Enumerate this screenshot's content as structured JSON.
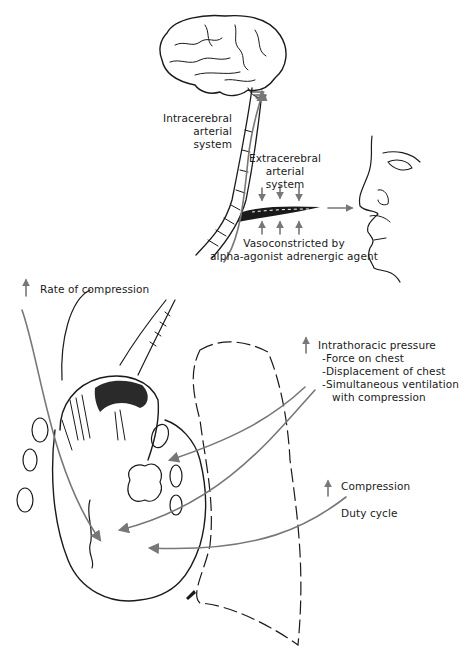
{
  "figure": {
    "colors": {
      "ink": "#1a1a1a",
      "arrow": "#777777",
      "background": "#ffffff"
    },
    "labels": {
      "intracerebral": [
        "Intracerebral",
        "arterial",
        "system"
      ],
      "extracerebral": [
        "Extracerebral",
        "arterial",
        "system"
      ],
      "vasoconstricted": [
        "Vasoconstricted by",
        "alpha-agonist adrenergic agent"
      ],
      "rate_of_compression": "Rate of compression",
      "intrathoracic": {
        "title": "Intrathoracic pressure",
        "items": [
          "-Force on chest",
          "-Displacement of chest",
          "-Simultaneous ventilation",
          "with compression"
        ]
      },
      "compression": "Compression",
      "duty_cycle": "Duty cycle"
    },
    "icons": {
      "up_arrow": "increase-arrow-icon",
      "brain": "brain-icon",
      "face": "face-profile-icon",
      "heart": "heart-icon",
      "lung": "lung-outline-icon"
    }
  }
}
